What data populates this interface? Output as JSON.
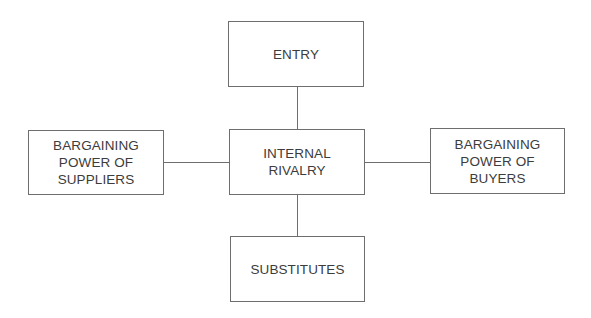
{
  "diagram": {
    "type": "five-forces",
    "nodes": {
      "top": {
        "label": "ENTRY"
      },
      "center": {
        "label": "INTERNAL\nRIVALRY"
      },
      "left": {
        "label": "BARGAINING\nPOWER OF\nSUPPLIERS"
      },
      "right": {
        "label": "BARGAINING\nPOWER OF\nBUYERS"
      },
      "bottom": {
        "label": "SUBSTITUTES"
      }
    },
    "edges": [
      {
        "from": "top",
        "to": "center"
      },
      {
        "from": "left",
        "to": "center"
      },
      {
        "from": "center",
        "to": "right"
      },
      {
        "from": "center",
        "to": "bottom"
      }
    ],
    "colors": {
      "border": "#6e6e6e",
      "text": "#3c3c3c",
      "background": "#ffffff"
    }
  }
}
